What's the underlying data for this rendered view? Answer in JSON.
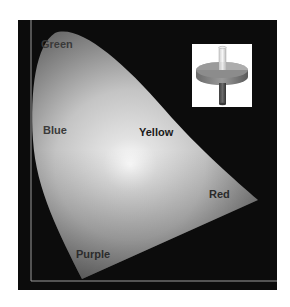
{
  "diagram": {
    "type": "chromaticity-gamut",
    "background_color": "#0c0c0c",
    "region_labels": {
      "green": "Green",
      "blue": "Blue",
      "yellow": "Yellow",
      "red": "Red",
      "purple": "Purple"
    },
    "inset_icon": "color-solid-disc-icon"
  }
}
